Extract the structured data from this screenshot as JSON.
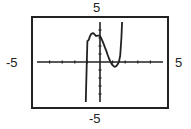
{
  "window_labels": {
    "ymax": "5",
    "ymin": "-5",
    "xmin": "-5",
    "xmax": "5"
  },
  "chart_data": {
    "type": "line",
    "title": "",
    "xlabel": "",
    "ylabel": "",
    "xlim": [
      -5,
      5
    ],
    "ylim": [
      -5,
      5
    ],
    "xticks": [
      -4,
      -3,
      -2,
      -1,
      1,
      2,
      3,
      4
    ],
    "yticks": [
      -4,
      -3,
      -2,
      -1,
      1,
      2,
      3,
      4
    ],
    "grid": false,
    "legend": null,
    "series": [
      {
        "name": "f(x)",
        "description": "cubic with local max near (-0.5, 3.6) and local min near (1.2, -0.6)",
        "x": [
          -1.13,
          -1.1,
          -1.05,
          -1.0,
          -0.9,
          -0.8,
          -0.7,
          -0.6,
          -0.5,
          -0.4,
          -0.3,
          -0.2,
          -0.1,
          0.0,
          0.1,
          0.2,
          0.3,
          0.4,
          0.5,
          0.6,
          0.7,
          0.8,
          0.85,
          0.9,
          1.0,
          1.1,
          1.2,
          1.3,
          1.4,
          1.5,
          1.6,
          1.7,
          1.75
        ],
        "y": [
          -5.0,
          -3.3,
          0.0,
          2.6,
          2.75,
          3.2,
          3.5,
          3.6,
          3.56,
          3.4,
          3.25,
          3.3,
          3.3,
          3.25,
          2.95,
          2.6,
          2.2,
          1.8,
          1.4,
          0.9,
          0.5,
          0.15,
          0.0,
          -0.18,
          -0.4,
          -0.55,
          -0.6,
          -0.5,
          -0.3,
          0.0,
          0.8,
          3.0,
          5.0
        ]
      }
    ]
  }
}
